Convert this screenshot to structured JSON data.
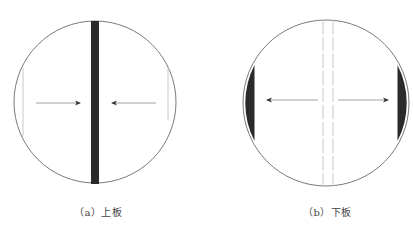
{
  "figure": {
    "panels": [
      {
        "id": "a",
        "caption": "（a）上板",
        "description": "Circle with a dark vertical bar through the center; arrows on both sides point inward toward the bar; thin vertical lines near left and right edges",
        "bar_color": "#2a2a2a"
      },
      {
        "id": "b",
        "caption": "（b）下板",
        "description": "Circle with two faint vertical dashed lines in the center; arrows point outward toward dark crescent segments on left and right edges",
        "segment_color": "#2a2a2a"
      }
    ],
    "colors": {
      "outline": "#7a7a7a",
      "dark_fill": "#2a2a2a",
      "arrow": "#8a8a8a",
      "faint_line": "#c8c8c8"
    }
  }
}
